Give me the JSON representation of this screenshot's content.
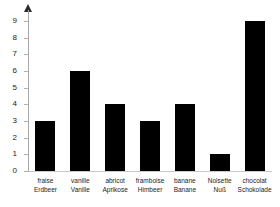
{
  "chart_data": {
    "type": "bar",
    "title": "",
    "subtitle": "",
    "xlabel": "",
    "ylabel": "",
    "categories": [
      "fraise / Erdbeer",
      "vanille / Vanille",
      "abricot / Aprikose",
      "framboise / Himbeer",
      "banane / Banane",
      "Noisette / Nuß",
      "chocolat / Schokolade"
    ],
    "categories_fr": [
      "fraise",
      "vanille",
      "abricot",
      "framboise",
      "banane",
      "Noisette",
      "chocolat"
    ],
    "categories_de": [
      "Erdbeer",
      "Vanille",
      "Aprikose",
      "Himbeer",
      "Banane",
      "Nuß",
      "Schokolade"
    ],
    "values": [
      3,
      6,
      4,
      3,
      4,
      1,
      9
    ],
    "series": [
      {
        "name": "",
        "values": [
          3,
          6,
          4,
          3,
          4,
          1,
          9
        ]
      }
    ],
    "ylim": [
      0,
      9
    ],
    "ytick_labels": [
      "9",
      "8",
      "7",
      "6",
      "5",
      "4",
      "3",
      "2",
      "1",
      "0"
    ],
    "ytick_values": [
      9,
      8,
      7,
      6,
      5,
      4,
      3,
      2,
      1,
      0
    ],
    "grid": false,
    "legend": null,
    "bar_color": "#000000",
    "axis_color": "#a8a8a8",
    "baseline_color": "#c9c9c9",
    "text_color": "#1c1c1c",
    "background_color": "#ffffff",
    "y_axis_has_arrow": true
  }
}
